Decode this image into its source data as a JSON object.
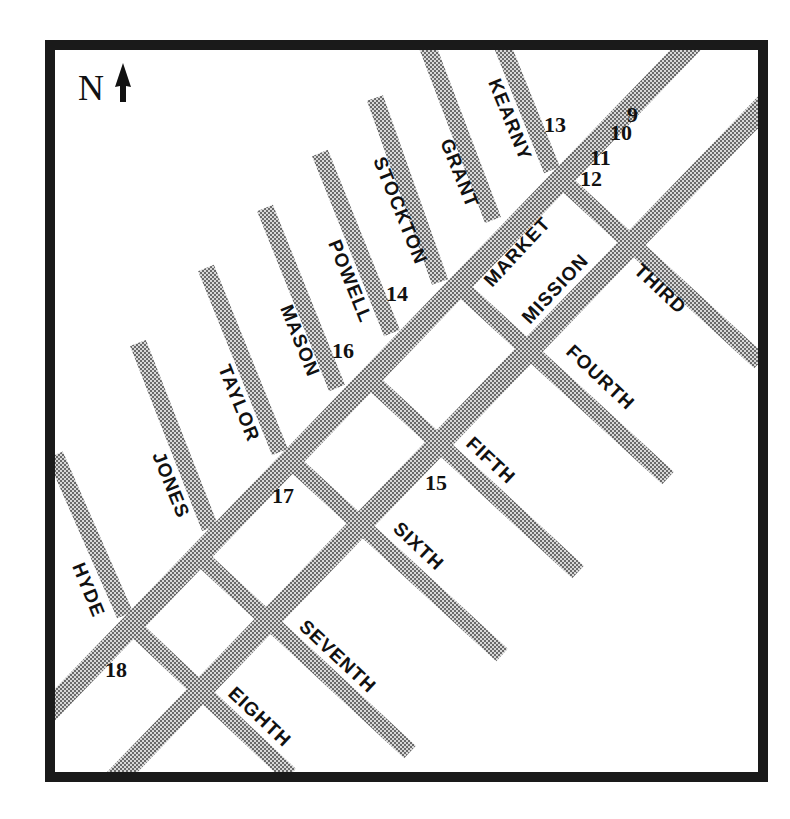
{
  "map": {
    "north_indicator": {
      "letter": "N",
      "icon": "north-arrow-icon"
    },
    "colors": {
      "frame": "#1a1a1a",
      "street": "#9a9a9a",
      "text": "#111111",
      "background": "#ffffff"
    },
    "main_streets": [
      {
        "name": "MARKET"
      },
      {
        "name": "MISSION"
      }
    ],
    "north_south_streets": [
      {
        "name": "KEARNY"
      },
      {
        "name": "GRANT"
      },
      {
        "name": "STOCKTON"
      },
      {
        "name": "POWELL"
      },
      {
        "name": "MASON"
      },
      {
        "name": "TAYLOR"
      },
      {
        "name": "JONES"
      },
      {
        "name": "HYDE"
      }
    ],
    "cross_streets": [
      {
        "name": "THIRD"
      },
      {
        "name": "FOURTH"
      },
      {
        "name": "FIFTH"
      },
      {
        "name": "SIXTH"
      },
      {
        "name": "SEVENTH"
      },
      {
        "name": "EIGHTH"
      }
    ],
    "location_numbers": [
      "9",
      "10",
      "11",
      "12",
      "13",
      "14",
      "15",
      "16",
      "17",
      "18"
    ]
  }
}
